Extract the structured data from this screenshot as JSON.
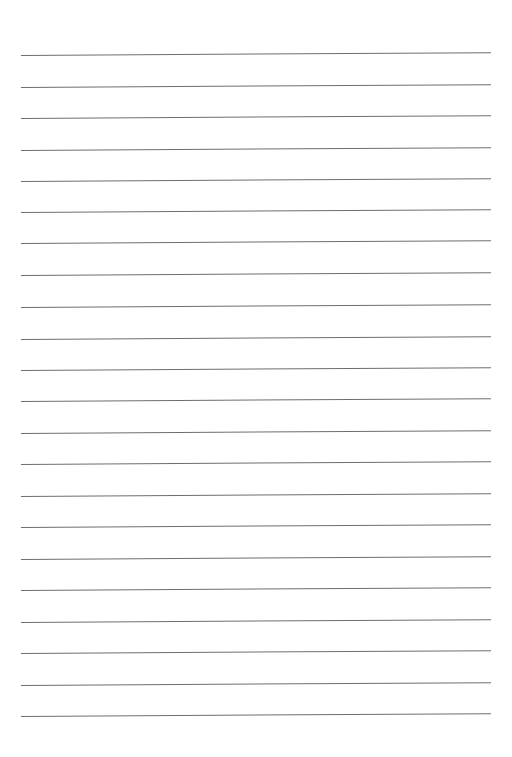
{
  "page": {
    "type": "lined-paper",
    "background": "#ffffff",
    "line_color": "#6e6e6e",
    "line_count": 22,
    "lines_top": [
      55,
      87,
      118,
      150,
      181,
      212,
      243,
      275,
      307,
      339,
      370,
      401,
      433,
      464,
      496,
      527,
      559,
      590,
      622,
      653,
      685,
      716
    ]
  }
}
